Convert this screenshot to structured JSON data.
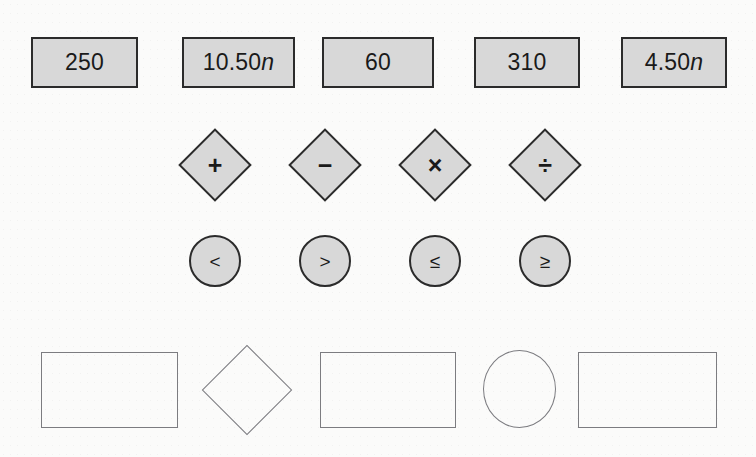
{
  "canvas": {
    "width": 756,
    "height": 457,
    "background_color": "#fbfbfa",
    "shape_fill_color": "#d8d8d8",
    "shape_border_color": "#2b2b2b",
    "slot_border_color": "#7c7c80"
  },
  "value_tiles": [
    {
      "name": "tile-250",
      "text": "250",
      "italic_suffix": "",
      "x": 31,
      "y": 37,
      "w": 107,
      "h": 51
    },
    {
      "name": "tile-10-50n",
      "text": "10.50",
      "italic_suffix": "n",
      "x": 182,
      "y": 37,
      "w": 113,
      "h": 51
    },
    {
      "name": "tile-60",
      "text": "60",
      "italic_suffix": "",
      "x": 322,
      "y": 37,
      "w": 112,
      "h": 51
    },
    {
      "name": "tile-310",
      "text": "310",
      "italic_suffix": "",
      "x": 474,
      "y": 37,
      "w": 106,
      "h": 51
    },
    {
      "name": "tile-4-50n",
      "text": "4.50",
      "italic_suffix": "n",
      "x": 621,
      "y": 37,
      "w": 106,
      "h": 51
    }
  ],
  "operator_diamonds": [
    {
      "name": "operator-plus",
      "symbol": "+",
      "icon": "plus-icon",
      "cx": 215,
      "cy": 165,
      "size": 52
    },
    {
      "name": "operator-minus",
      "symbol": "−",
      "icon": "minus-icon",
      "cx": 325,
      "cy": 165,
      "size": 52
    },
    {
      "name": "operator-multiply",
      "symbol": "×",
      "icon": "multiply-icon",
      "cx": 435,
      "cy": 165,
      "size": 52
    },
    {
      "name": "operator-divide",
      "symbol": "÷",
      "icon": "divide-icon",
      "cx": 545,
      "cy": 165,
      "size": 52
    }
  ],
  "comparison_circles": [
    {
      "name": "comparator-less-than",
      "symbol": "<",
      "icon": "less-than-icon",
      "cx": 215,
      "cy": 261,
      "d": 52
    },
    {
      "name": "comparator-greater-than",
      "symbol": ">",
      "icon": "greater-than-icon",
      "cx": 325,
      "cy": 261,
      "d": 52
    },
    {
      "name": "comparator-less-than-or-equal",
      "symbol": "≤",
      "icon": "less-than-or-equal-icon",
      "cx": 435,
      "cy": 261,
      "d": 52
    },
    {
      "name": "comparator-greater-than-or-equal",
      "symbol": "≥",
      "icon": "greater-than-or-equal-icon",
      "cx": 545,
      "cy": 261,
      "d": 52
    }
  ],
  "drop_slots": [
    {
      "name": "drop-slot-1",
      "shape": "rect",
      "text": "",
      "x": 41,
      "y": 352,
      "w": 137,
      "h": 76
    },
    {
      "name": "drop-slot-2",
      "shape": "diamond",
      "text": "",
      "cx": 247,
      "cy": 390,
      "size": 64
    },
    {
      "name": "drop-slot-3",
      "shape": "rect",
      "text": "",
      "x": 320,
      "y": 352,
      "w": 136,
      "h": 76
    },
    {
      "name": "drop-slot-4",
      "shape": "ellipse",
      "text": "",
      "x": 483,
      "y": 350,
      "w": 73,
      "h": 78
    },
    {
      "name": "drop-slot-5",
      "shape": "rect",
      "text": "",
      "x": 578,
      "y": 352,
      "w": 139,
      "h": 76
    }
  ]
}
